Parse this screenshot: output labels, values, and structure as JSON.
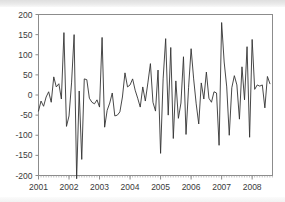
{
  "chart_data": {
    "type": "line",
    "title": "",
    "subtitle": "",
    "xlabel": "",
    "ylabel": "",
    "xlim": [
      2001.0,
      2008.6667
    ],
    "ylim": [
      -200,
      200
    ],
    "grid": false,
    "legend": null,
    "legend_position": "none",
    "line_color": "#333333",
    "frame_color": "#808080",
    "background_color": "#ffffff",
    "y_ticks": [
      200,
      150,
      100,
      50,
      0,
      -50,
      -100,
      -150,
      -200
    ],
    "y_tick_labels": [
      "200",
      "150",
      "100",
      "50",
      "0",
      "-50",
      "-100",
      "-150",
      "-200"
    ],
    "x_ticks": [
      2001,
      2002,
      2003,
      2004,
      2005,
      2006,
      2007,
      2008
    ],
    "x_tick_labels": [
      "2001",
      "2002",
      "2003",
      "2004",
      "2005",
      "2006",
      "2007",
      "2008"
    ],
    "x_minor_tick_interval": 0.0833,
    "series_name": "residuals",
    "frequency": "monthly",
    "n_points": 92,
    "x": [
      2001.0,
      2001.0833,
      2001.1667,
      2001.25,
      2001.3333,
      2001.4167,
      2001.5,
      2001.5833,
      2001.6667,
      2001.75,
      2001.8333,
      2001.9167,
      2002.0,
      2002.0833,
      2002.1667,
      2002.25,
      2002.3333,
      2002.4167,
      2002.5,
      2002.5833,
      2002.6667,
      2002.75,
      2002.8333,
      2002.9167,
      2003.0,
      2003.0833,
      2003.1667,
      2003.25,
      2003.3333,
      2003.4167,
      2003.5,
      2003.5833,
      2003.6667,
      2003.75,
      2003.8333,
      2003.9167,
      2004.0,
      2004.0833,
      2004.1667,
      2004.25,
      2004.3333,
      2004.4167,
      2004.5,
      2004.5833,
      2004.6667,
      2004.75,
      2004.8333,
      2004.9167,
      2005.0,
      2005.0833,
      2005.1667,
      2005.25,
      2005.3333,
      2005.4167,
      2005.5,
      2005.5833,
      2005.6667,
      2005.75,
      2005.8333,
      2005.9167,
      2006.0,
      2006.0833,
      2006.1667,
      2006.25,
      2006.3333,
      2006.4167,
      2006.5,
      2006.5833,
      2006.6667,
      2006.75,
      2006.8333,
      2006.9167,
      2007.0,
      2007.0833,
      2007.1667,
      2007.25,
      2007.3333,
      2007.4167,
      2007.5,
      2007.5833,
      2007.6667,
      2007.75,
      2007.8333,
      2007.9167,
      2008.0,
      2008.0833,
      2008.1667,
      2008.25,
      2008.3333,
      2008.4167,
      2008.5,
      2008.5833
    ],
    "values": [
      -40,
      -15,
      -28,
      -5,
      8,
      -18,
      45,
      20,
      28,
      -10,
      155,
      -78,
      -52,
      30,
      150,
      -208,
      10,
      -160,
      40,
      38,
      -8,
      -18,
      -22,
      -12,
      -30,
      143,
      -80,
      -38,
      -20,
      5,
      -52,
      -50,
      -42,
      -5,
      55,
      20,
      25,
      40,
      12,
      -8,
      -30,
      20,
      -15,
      30,
      78,
      -18,
      -40,
      62,
      -145,
      40,
      140,
      -50,
      118,
      -108,
      35,
      -58,
      -20,
      95,
      -98,
      18,
      115,
      40,
      -22,
      -72,
      30,
      -10,
      57,
      -8,
      -18,
      8,
      5,
      -125,
      180,
      82,
      20,
      -100,
      18,
      48,
      25,
      -60,
      70,
      -12,
      120,
      -105,
      138,
      14,
      25,
      22,
      25,
      -32,
      46,
      28
    ]
  }
}
